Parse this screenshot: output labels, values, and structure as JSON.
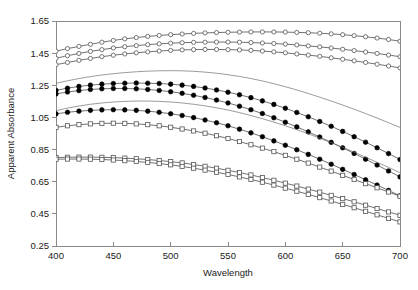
{
  "chart_data": {
    "type": "line",
    "title": "",
    "xlabel": "Wavelength",
    "ylabel": "Apparent Absorbance",
    "xlim": [
      400,
      700
    ],
    "ylim": [
      0.25,
      1.65
    ],
    "xticks": [
      400,
      450,
      500,
      550,
      600,
      650,
      700
    ],
    "xtick_labels": [
      "400",
      "450",
      "500",
      "550",
      "600",
      "650",
      "700"
    ],
    "yticks": [
      0.25,
      0.45,
      0.65,
      0.85,
      1.05,
      1.25,
      1.45,
      1.65
    ],
    "ytick_labels": [
      "0.25",
      "0.45",
      "0.65",
      "0.85",
      "1.05",
      "1.25",
      "1.45",
      "1.65"
    ],
    "grid": false,
    "legend": "none",
    "x": [
      400,
      410,
      420,
      430,
      440,
      450,
      460,
      470,
      480,
      490,
      500,
      510,
      520,
      530,
      540,
      550,
      560,
      570,
      580,
      590,
      600,
      610,
      620,
      630,
      640,
      650,
      660,
      670,
      680,
      690,
      700
    ],
    "series": [
      {
        "name": "series-1",
        "marker": "open-circle",
        "values": [
          1.462,
          1.478,
          1.492,
          1.505,
          1.518,
          1.529,
          1.539,
          1.547,
          1.554,
          1.56,
          1.565,
          1.569,
          1.573,
          1.576,
          1.578,
          1.58,
          1.581,
          1.582,
          1.582,
          1.582,
          1.581,
          1.579,
          1.577,
          1.574,
          1.57,
          1.565,
          1.559,
          1.552,
          1.544,
          1.535,
          1.524
        ]
      },
      {
        "name": "series-2",
        "marker": "open-circle",
        "values": [
          1.418,
          1.434,
          1.448,
          1.461,
          1.472,
          1.482,
          1.49,
          1.497,
          1.503,
          1.508,
          1.512,
          1.515,
          1.517,
          1.518,
          1.519,
          1.519,
          1.518,
          1.516,
          1.513,
          1.51,
          1.506,
          1.501,
          1.495,
          1.489,
          1.482,
          1.474,
          1.466,
          1.457,
          1.448,
          1.438,
          1.428
        ]
      },
      {
        "name": "series-3",
        "marker": "open-circle",
        "values": [
          1.378,
          1.392,
          1.405,
          1.417,
          1.428,
          1.437,
          1.445,
          1.452,
          1.458,
          1.463,
          1.467,
          1.47,
          1.472,
          1.473,
          1.473,
          1.472,
          1.47,
          1.467,
          1.463,
          1.458,
          1.452,
          1.445,
          1.438,
          1.43,
          1.421,
          1.412,
          1.402,
          1.392,
          1.381,
          1.37,
          1.358
        ]
      },
      {
        "name": "series-4",
        "marker": "none",
        "values": [
          1.262,
          1.278,
          1.292,
          1.304,
          1.314,
          1.322,
          1.329,
          1.334,
          1.338,
          1.34,
          1.341,
          1.34,
          1.337,
          1.332,
          1.325,
          1.316,
          1.305,
          1.292,
          1.277,
          1.26,
          1.241,
          1.221,
          1.199,
          1.176,
          1.152,
          1.127,
          1.101,
          1.074,
          1.046,
          1.017,
          0.988
        ]
      },
      {
        "name": "series-5",
        "marker": "filled-circle",
        "values": [
          1.218,
          1.232,
          1.243,
          1.251,
          1.257,
          1.261,
          1.263,
          1.264,
          1.263,
          1.261,
          1.257,
          1.251,
          1.243,
          1.233,
          1.221,
          1.207,
          1.191,
          1.173,
          1.153,
          1.131,
          1.107,
          1.081,
          1.054,
          1.025,
          0.995,
          0.963,
          0.93,
          0.896,
          0.861,
          0.825,
          0.788
        ]
      },
      {
        "name": "series-6",
        "marker": "filled-circle",
        "values": [
          1.196,
          1.208,
          1.217,
          1.224,
          1.228,
          1.23,
          1.23,
          1.228,
          1.224,
          1.218,
          1.21,
          1.2,
          1.188,
          1.174,
          1.158,
          1.14,
          1.12,
          1.098,
          1.074,
          1.048,
          1.02,
          0.991,
          0.96,
          0.928,
          0.895,
          0.861,
          0.826,
          0.79,
          0.754,
          0.717,
          0.68
        ]
      },
      {
        "name": "series-7",
        "marker": "none",
        "values": [
          1.092,
          1.108,
          1.121,
          1.132,
          1.14,
          1.146,
          1.15,
          1.152,
          1.152,
          1.15,
          1.146,
          1.14,
          1.132,
          1.122,
          1.11,
          1.096,
          1.08,
          1.062,
          1.042,
          1.021,
          0.998,
          0.974,
          0.948,
          0.921,
          0.893,
          0.864,
          0.834,
          0.803,
          0.771,
          0.739,
          0.706
        ]
      },
      {
        "name": "series-8",
        "marker": "filled-circle",
        "values": [
          1.072,
          1.082,
          1.089,
          1.094,
          1.097,
          1.098,
          1.097,
          1.094,
          1.089,
          1.082,
          1.073,
          1.062,
          1.049,
          1.034,
          1.017,
          0.998,
          0.977,
          0.954,
          0.93,
          0.904,
          0.877,
          0.849,
          0.82,
          0.79,
          0.759,
          0.727,
          0.695,
          0.662,
          0.629,
          0.596,
          0.562
        ]
      },
      {
        "name": "series-9",
        "marker": "open-square",
        "values": [
          0.988,
          0.998,
          1.005,
          1.01,
          1.013,
          1.014,
          1.013,
          1.01,
          1.005,
          0.998,
          0.989,
          0.978,
          0.966,
          0.952,
          0.936,
          0.919,
          0.9,
          0.88,
          0.859,
          0.837,
          0.814,
          0.79,
          0.766,
          0.741,
          0.716,
          0.69,
          0.664,
          0.638,
          0.612,
          0.586,
          0.56
        ]
      },
      {
        "name": "series-10",
        "marker": "open-square",
        "values": [
          0.8,
          0.802,
          0.803,
          0.803,
          0.802,
          0.8,
          0.797,
          0.793,
          0.788,
          0.782,
          0.775,
          0.767,
          0.757,
          0.746,
          0.734,
          0.721,
          0.707,
          0.692,
          0.676,
          0.659,
          0.641,
          0.623,
          0.604,
          0.585,
          0.565,
          0.545,
          0.525,
          0.504,
          0.483,
          0.462,
          0.441
        ]
      },
      {
        "name": "series-11",
        "marker": "open-square",
        "values": [
          0.79,
          0.791,
          0.791,
          0.79,
          0.788,
          0.785,
          0.781,
          0.776,
          0.77,
          0.763,
          0.755,
          0.745,
          0.734,
          0.722,
          0.709,
          0.695,
          0.68,
          0.664,
          0.647,
          0.629,
          0.61,
          0.591,
          0.571,
          0.551,
          0.53,
          0.509,
          0.488,
          0.466,
          0.444,
          0.422,
          0.4
        ]
      }
    ]
  },
  "axes": {
    "x_title": "Wavelength",
    "y_title": "Apparent Absorbance"
  }
}
